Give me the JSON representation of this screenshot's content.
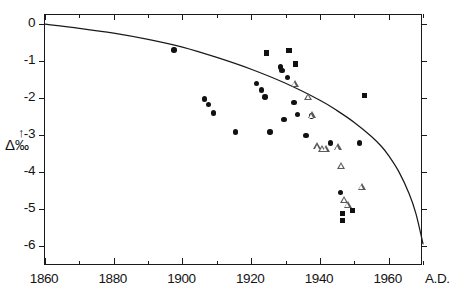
{
  "chart_data": {
    "type": "scatter",
    "title": "",
    "subtitle": "",
    "xlabel": "A.D.",
    "ylabel": "Δ ‰",
    "xlim": [
      1860,
      1970
    ],
    "ylim": [
      -6.55,
      0.25
    ],
    "grid": false,
    "legend_position": "none",
    "x_ticks_major": [
      1860,
      1880,
      1900,
      1920,
      1940,
      1960
    ],
    "x_ticks_minor": [
      1870,
      1890,
      1910,
      1930,
      1950,
      1970
    ],
    "x_tick_labels": [
      "1860",
      "1880",
      "1900",
      "1920",
      "1940",
      "1960"
    ],
    "y_ticks": [
      0,
      -1,
      -2,
      -3,
      -4,
      -5,
      -6
    ],
    "y_tick_labels": [
      "0",
      "-1",
      "-2",
      "-3",
      "-4",
      "-5",
      "-6"
    ],
    "series": [
      {
        "name": "filled circles",
        "marker": "circle",
        "filled": true,
        "color": "#111111",
        "points": [
          {
            "x": 1897.5,
            "y": -0.7
          },
          {
            "x": 1906.5,
            "y": -2.03
          },
          {
            "x": 1907.5,
            "y": -2.17
          },
          {
            "x": 1909.0,
            "y": -2.4
          },
          {
            "x": 1915.5,
            "y": -2.92
          },
          {
            "x": 1921.5,
            "y": -1.6
          },
          {
            "x": 1923.0,
            "y": -1.78
          },
          {
            "x": 1924.0,
            "y": -1.97
          },
          {
            "x": 1925.5,
            "y": -2.92
          },
          {
            "x": 1928.5,
            "y": -1.16
          },
          {
            "x": 1929.0,
            "y": -1.26
          },
          {
            "x": 1929.5,
            "y": -2.58
          },
          {
            "x": 1930.5,
            "y": -1.44
          },
          {
            "x": 1932.5,
            "y": -2.12
          },
          {
            "x": 1933.5,
            "y": -2.44
          },
          {
            "x": 1936.0,
            "y": -3.02
          },
          {
            "x": 1937.5,
            "y": -2.49
          },
          {
            "x": 1943.0,
            "y": -3.22
          },
          {
            "x": 1946.0,
            "y": -4.56
          },
          {
            "x": 1951.5,
            "y": -3.22
          }
        ]
      },
      {
        "name": "filled squares",
        "marker": "square",
        "filled": true,
        "color": "#111111",
        "points": [
          {
            "x": 1924.5,
            "y": -0.78
          },
          {
            "x": 1931.0,
            "y": -0.72
          },
          {
            "x": 1933.0,
            "y": -1.08
          },
          {
            "x": 1946.5,
            "y": -5.13
          },
          {
            "x": 1946.5,
            "y": -5.32
          },
          {
            "x": 1949.5,
            "y": -5.05
          },
          {
            "x": 1953.0,
            "y": -1.93
          }
        ]
      },
      {
        "name": "open triangles",
        "marker": "triangle",
        "filled": false,
        "color": "#5a5a5a",
        "points": [
          {
            "x": 1931.5,
            "y": -1.6
          },
          {
            "x": 1935.5,
            "y": -1.96
          },
          {
            "x": 1936.5,
            "y": -2.46
          },
          {
            "x": 1938.0,
            "y": -3.3
          },
          {
            "x": 1939.5,
            "y": -3.36
          },
          {
            "x": 1940.5,
            "y": -3.36
          },
          {
            "x": 1944.0,
            "y": -3.32
          },
          {
            "x": 1945.0,
            "y": -3.82
          },
          {
            "x": 1946.0,
            "y": -4.74
          },
          {
            "x": 1947.0,
            "y": -4.88
          },
          {
            "x": 1951.0,
            "y": -4.4
          }
        ]
      }
    ],
    "curve": {
      "name": "model curve",
      "color": "#1a1a1a",
      "points": [
        {
          "x": 1860,
          "y": 0.0
        },
        {
          "x": 1870,
          "y": -0.11
        },
        {
          "x": 1880,
          "y": -0.24
        },
        {
          "x": 1890,
          "y": -0.41
        },
        {
          "x": 1900,
          "y": -0.62
        },
        {
          "x": 1910,
          "y": -0.9
        },
        {
          "x": 1920,
          "y": -1.22
        },
        {
          "x": 1930,
          "y": -1.6
        },
        {
          "x": 1940,
          "y": -2.06
        },
        {
          "x": 1945,
          "y": -2.34
        },
        {
          "x": 1950,
          "y": -2.66
        },
        {
          "x": 1955,
          "y": -3.04
        },
        {
          "x": 1958,
          "y": -3.32
        },
        {
          "x": 1960,
          "y": -3.56
        },
        {
          "x": 1963,
          "y": -4.0
        },
        {
          "x": 1966,
          "y": -4.6
        },
        {
          "x": 1968,
          "y": -5.15
        },
        {
          "x": 1970,
          "y": -5.95
        }
      ]
    }
  },
  "axis": {
    "y_title_arrow": "↑",
    "y_title_delta": "Δ",
    "y_title_permil": "‰",
    "x_end_label": "A.D."
  }
}
